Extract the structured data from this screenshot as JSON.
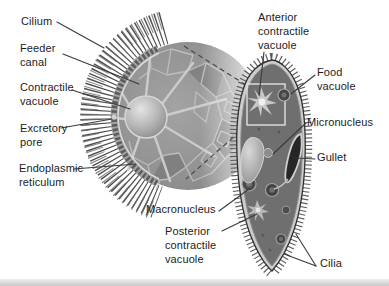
{
  "figure": {
    "type": "labeled-anatomy-diagram",
    "background_color": "#ffffff",
    "ink_color": "#1c1c1c",
    "cell_gray": "#6f6f6f",
    "membrane_gray": "#c9c9c9"
  },
  "labels": {
    "cilium": "Cilium",
    "feeder_canal": "Feeder\ncanal",
    "contractile_vacuole": "Contractile\nvacuole",
    "excretory_pore": "Excretory\npore",
    "endoplasmic_reticulum": "Endoplasmic\nreticulum",
    "macronucleus": "Macronucleus",
    "posterior_contractile_vacuole": "Posterior\ncontractile\nvacuole",
    "anterior_contractile_vacuole": "Anterior\ncontractile\nvacuole",
    "food_vacuole": "Food\nvacuole",
    "micronucleus": "Micronucleus",
    "gullet": "Gullet",
    "cilia": "Cilia"
  }
}
